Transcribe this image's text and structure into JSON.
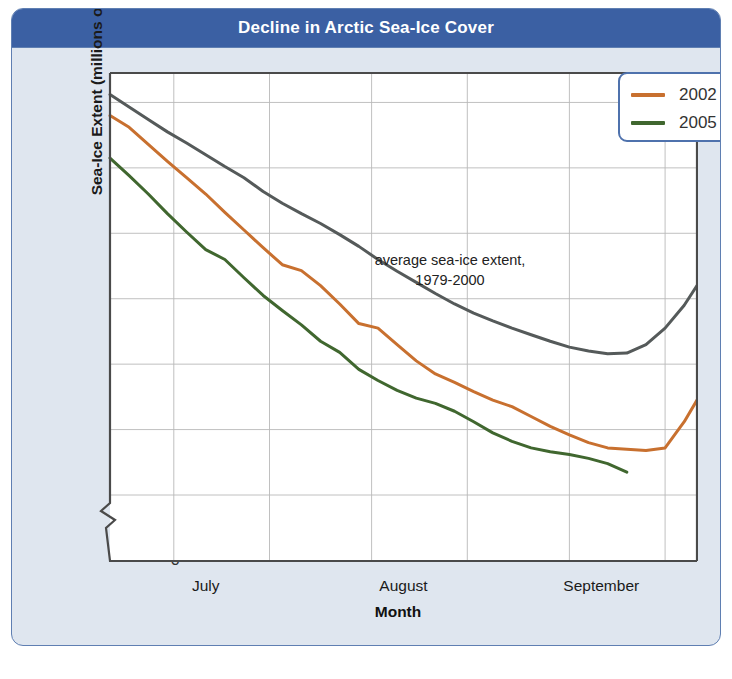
{
  "figure": {
    "title": "Decline in Arctic Sea-Ice Cover",
    "title_bg": "#3b60a3",
    "panel_bg": "#dfe6ef",
    "border_color": "#5f7fb2"
  },
  "legend": {
    "position": "top-right",
    "entries": [
      {
        "label": "2002",
        "color": "#c8702f"
      },
      {
        "label": "2005",
        "color": "#40672f"
      }
    ]
  },
  "annotation": {
    "line1": "average sea-ice extent,",
    "line2": "1979-2000"
  },
  "chart_data": {
    "type": "line",
    "title": "Decline in Arctic Sea-Ice Cover",
    "xlabel": "Month",
    "ylabel": "Sea-Ice Extent (millions of km²)",
    "ylabel_text": "Sea-Ice Extent (millions of km",
    "ylabel_sup": "2",
    "ylabel_tail": ")",
    "grid": true,
    "axis_break": {
      "between": [
        0,
        5
      ],
      "shown": true
    },
    "ylim": [
      5,
      11.45
    ],
    "yticks": [
      11,
      10,
      9,
      8,
      7,
      6,
      5,
      0
    ],
    "xlim": [
      0,
      92
    ],
    "xtick_labels": [
      "July",
      "August",
      "September"
    ],
    "xtick_positions": [
      15,
      46,
      77
    ],
    "x_gridlines": [
      10,
      25,
      41,
      56,
      72,
      87
    ],
    "series": [
      {
        "name": "average sea-ice extent, 1979-2000",
        "color": "#555a5a",
        "width": 3.0,
        "x": [
          0,
          3,
          6,
          9,
          12,
          15,
          18,
          21,
          24,
          27,
          30,
          33,
          36,
          39,
          42,
          45,
          48,
          51,
          54,
          57,
          60,
          63,
          66,
          69,
          72,
          75,
          78,
          81,
          84,
          87,
          90,
          92
        ],
        "y": [
          11.12,
          10.93,
          10.74,
          10.55,
          10.38,
          10.2,
          10.02,
          9.85,
          9.64,
          9.46,
          9.3,
          9.15,
          8.98,
          8.8,
          8.6,
          8.42,
          8.25,
          8.08,
          7.92,
          7.78,
          7.66,
          7.55,
          7.45,
          7.35,
          7.26,
          7.2,
          7.16,
          7.17,
          7.3,
          7.55,
          7.9,
          8.2
        ]
      },
      {
        "name": "2002",
        "color": "#c8702f",
        "width": 3.0,
        "x": [
          0,
          3,
          6,
          9,
          12,
          15,
          18,
          21,
          24,
          27,
          30,
          33,
          36,
          39,
          42,
          45,
          48,
          51,
          54,
          57,
          60,
          63,
          66,
          69,
          72,
          75,
          78,
          81,
          84,
          87,
          90,
          92
        ],
        "y": [
          10.8,
          10.62,
          10.36,
          10.1,
          9.85,
          9.6,
          9.32,
          9.05,
          8.78,
          8.52,
          8.43,
          8.2,
          7.92,
          7.62,
          7.55,
          7.3,
          7.05,
          6.85,
          6.72,
          6.58,
          6.45,
          6.35,
          6.2,
          6.05,
          5.92,
          5.8,
          5.72,
          5.7,
          5.68,
          5.72,
          6.12,
          6.45
        ]
      },
      {
        "name": "2005",
        "color": "#40672f",
        "width": 3.0,
        "x": [
          0,
          3,
          6,
          9,
          12,
          15,
          18,
          21,
          24,
          27,
          30,
          33,
          36,
          39,
          42,
          45,
          48,
          51,
          54,
          57,
          60,
          63,
          66,
          69,
          72,
          75,
          78,
          81
        ],
        "y": [
          10.15,
          9.88,
          9.6,
          9.3,
          9.02,
          8.75,
          8.6,
          8.32,
          8.05,
          7.82,
          7.6,
          7.35,
          7.18,
          6.92,
          6.75,
          6.6,
          6.48,
          6.4,
          6.28,
          6.12,
          5.95,
          5.82,
          5.72,
          5.66,
          5.62,
          5.56,
          5.48,
          5.35
        ]
      }
    ]
  }
}
